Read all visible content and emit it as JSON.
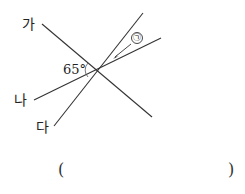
{
  "diagram": {
    "lines": [
      {
        "label": "가",
        "x1": 42,
        "y1": 24,
        "x2": 152,
        "y2": 117
      },
      {
        "label": "나",
        "x1": 34,
        "y1": 100,
        "x2": 161,
        "y2": 38
      },
      {
        "label": "다",
        "x1": 54,
        "y1": 126,
        "x2": 143,
        "y2": 13
      }
    ],
    "angle_label": "65°",
    "marked_angle": "㉠",
    "answer_open": "(",
    "answer_close": ")"
  }
}
